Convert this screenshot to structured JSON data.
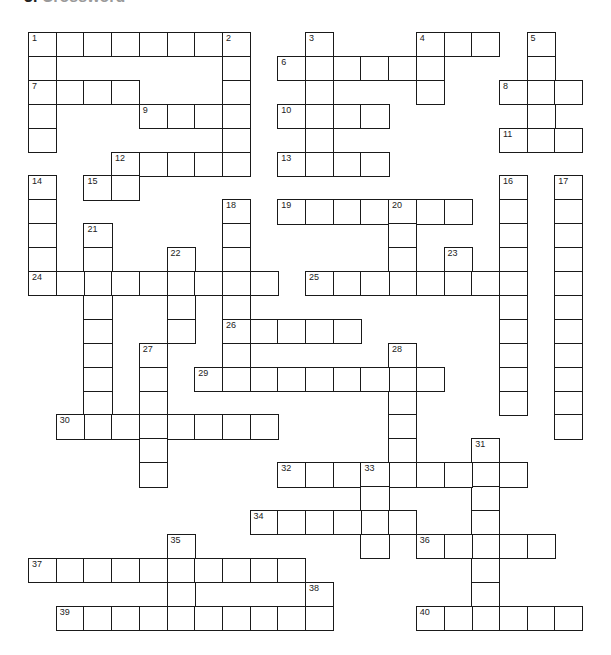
{
  "header": {
    "number": "3.",
    "title": "Crossword"
  },
  "grid": {
    "origin_x": 28,
    "origin_y": 32,
    "cell_w": 27.7,
    "cell_h": 23.9,
    "cols": 20,
    "rows": 25,
    "colors": {
      "line": "#1a1a1a",
      "fill": "#ffffff",
      "text": "#222222"
    }
  },
  "entries": [
    {
      "num": 1,
      "dir": "across",
      "row": 0,
      "col": 0,
      "len": 8
    },
    {
      "num": 1,
      "dir": "down",
      "row": 0,
      "col": 0,
      "len": 5
    },
    {
      "num": 2,
      "dir": "down",
      "row": 0,
      "col": 7,
      "len": 6
    },
    {
      "num": 3,
      "dir": "down",
      "row": 0,
      "col": 10,
      "len": 6
    },
    {
      "num": 4,
      "dir": "across",
      "row": 0,
      "col": 14,
      "len": 3
    },
    {
      "num": 4,
      "dir": "down",
      "row": 0,
      "col": 14,
      "len": 3
    },
    {
      "num": 5,
      "dir": "down",
      "row": 0,
      "col": 18,
      "len": 5
    },
    {
      "num": 6,
      "dir": "across",
      "row": 1,
      "col": 9,
      "len": 6
    },
    {
      "num": 7,
      "dir": "across",
      "row": 2,
      "col": 0,
      "len": 4
    },
    {
      "num": 8,
      "dir": "across",
      "row": 2,
      "col": 17,
      "len": 3
    },
    {
      "num": 9,
      "dir": "across",
      "row": 3,
      "col": 4,
      "len": 4
    },
    {
      "num": 10,
      "dir": "across",
      "row": 3,
      "col": 9,
      "len": 4
    },
    {
      "num": 11,
      "dir": "across",
      "row": 4,
      "col": 17,
      "len": 3
    },
    {
      "num": 12,
      "dir": "across",
      "row": 5,
      "col": 3,
      "len": 5
    },
    {
      "num": 13,
      "dir": "across",
      "row": 5,
      "col": 9,
      "len": 4
    },
    {
      "num": 14,
      "dir": "down",
      "row": 6,
      "col": 0,
      "len": 5
    },
    {
      "num": 15,
      "dir": "across",
      "row": 6,
      "col": 2,
      "len": 2
    },
    {
      "num": 16,
      "dir": "down",
      "row": 6,
      "col": 17,
      "len": 10
    },
    {
      "num": 17,
      "dir": "down",
      "row": 6,
      "col": 19,
      "len": 11
    },
    {
      "num": 18,
      "dir": "down",
      "row": 7,
      "col": 7,
      "len": 8
    },
    {
      "num": 19,
      "dir": "across",
      "row": 7,
      "col": 9,
      "len": 7
    },
    {
      "num": 20,
      "dir": "down",
      "row": 7,
      "col": 13,
      "len": 4
    },
    {
      "num": 21,
      "dir": "down",
      "row": 8,
      "col": 2,
      "len": 9
    },
    {
      "num": 22,
      "dir": "down",
      "row": 9,
      "col": 5,
      "len": 4
    },
    {
      "num": 23,
      "dir": "down",
      "row": 9,
      "col": 15,
      "len": 2
    },
    {
      "num": 24,
      "dir": "across",
      "row": 10,
      "col": 0,
      "len": 9
    },
    {
      "num": 25,
      "dir": "across",
      "row": 10,
      "col": 10,
      "len": 8
    },
    {
      "num": 26,
      "dir": "across",
      "row": 12,
      "col": 7,
      "len": 5
    },
    {
      "num": 27,
      "dir": "down",
      "row": 13,
      "col": 4,
      "len": 6
    },
    {
      "num": 28,
      "dir": "down",
      "row": 13,
      "col": 13,
      "len": 6
    },
    {
      "num": 29,
      "dir": "across",
      "row": 14,
      "col": 6,
      "len": 9
    },
    {
      "num": 30,
      "dir": "across",
      "row": 16,
      "col": 1,
      "len": 8
    },
    {
      "num": 31,
      "dir": "down",
      "row": 17,
      "col": 16,
      "len": 8
    },
    {
      "num": 32,
      "dir": "across",
      "row": 18,
      "col": 9,
      "len": 9
    },
    {
      "num": 33,
      "dir": "down",
      "row": 18,
      "col": 12,
      "len": 4
    },
    {
      "num": 34,
      "dir": "across",
      "row": 20,
      "col": 8,
      "len": 6
    },
    {
      "num": 35,
      "dir": "down",
      "row": 21,
      "col": 5,
      "len": 4
    },
    {
      "num": 36,
      "dir": "across",
      "row": 21,
      "col": 14,
      "len": 5
    },
    {
      "num": 37,
      "dir": "across",
      "row": 22,
      "col": 0,
      "len": 10
    },
    {
      "num": 38,
      "dir": "down",
      "row": 23,
      "col": 10,
      "len": 2
    },
    {
      "num": 39,
      "dir": "across",
      "row": 24,
      "col": 1,
      "len": 10
    },
    {
      "num": 40,
      "dir": "across",
      "row": 24,
      "col": 14,
      "len": 6
    }
  ]
}
